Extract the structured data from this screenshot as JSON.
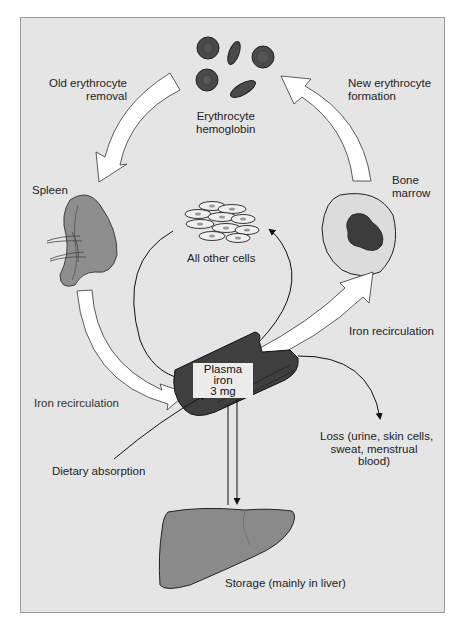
{
  "diagram": {
    "nodes": {
      "erythrocyte": {
        "line1": "Erythrocyte",
        "line2": "hemoglobin"
      },
      "spleen": {
        "label": "Spleen"
      },
      "bone_marrow": {
        "line1": "Bone",
        "line2": "marrow"
      },
      "other_cells": {
        "label": "All other cells"
      },
      "plasma": {
        "line1": "Plasma iron",
        "line2": "3 mg"
      },
      "liver": {
        "label": "Storage (mainly in liver)"
      }
    },
    "flows": {
      "old_removal": {
        "line1": "Old erythrocyte",
        "line2": "removal"
      },
      "new_formation": {
        "line1": "New erythrocyte",
        "line2": "formation"
      },
      "recirc_right": {
        "label": "Iron recirculation"
      },
      "recirc_left": {
        "label": "Iron recirculation"
      },
      "dietary": {
        "label": "Dietary absorption"
      },
      "loss": {
        "line1": "Loss (urine, skin cells,",
        "line2": "sweat, menstrual",
        "line3": "blood)"
      }
    },
    "colors": {
      "background": "#e5e5e5",
      "border": "#9a9a9a",
      "organ_fill": "#8a8a8a",
      "cell_fill": "#4a4a4a",
      "tube_fill": "#3f3f3f",
      "arrow_fill": "#ffffff",
      "ink": "#222222"
    }
  }
}
